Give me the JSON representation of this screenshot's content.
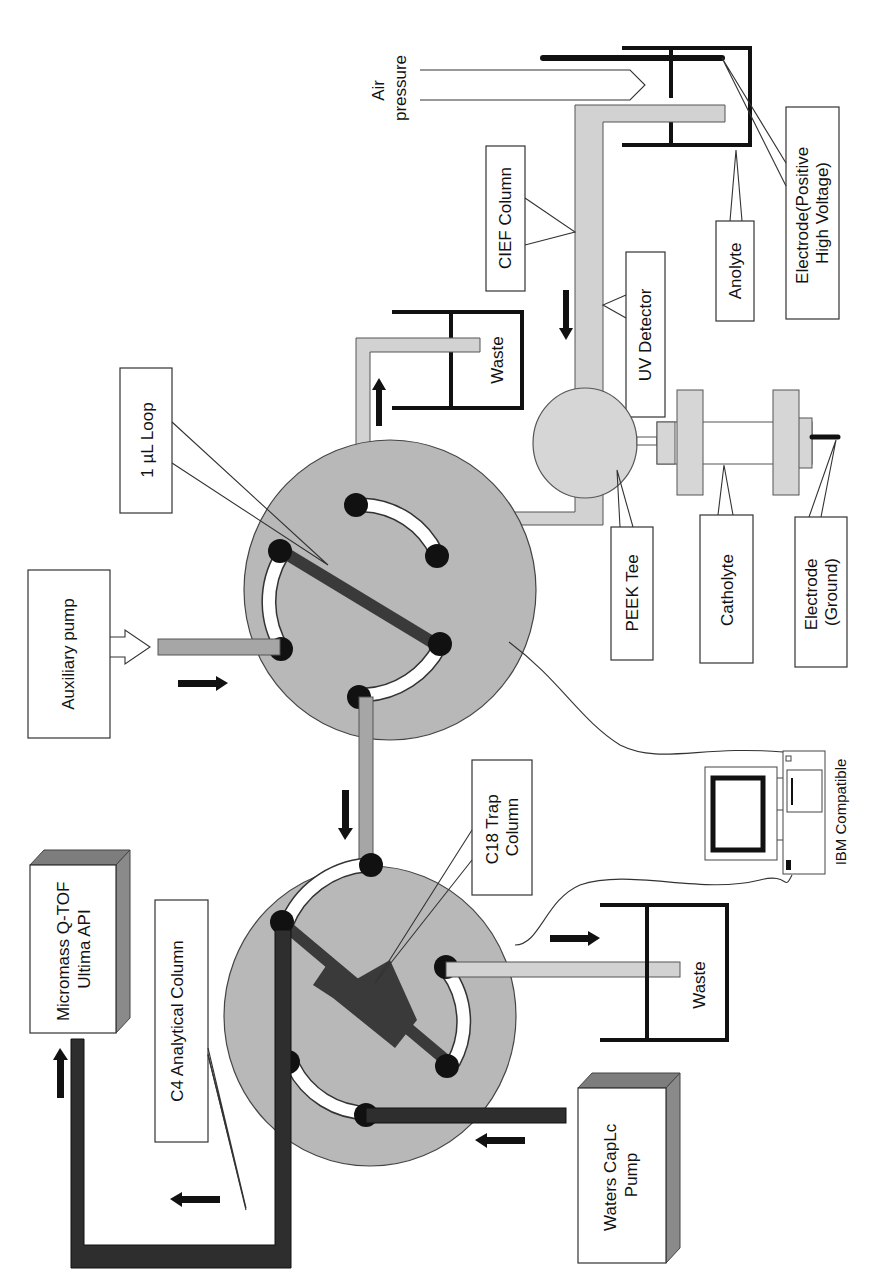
{
  "figure": {
    "type": "instrument schematic",
    "orientation": "rotated 90 degrees counter-clockwise"
  },
  "labels": {
    "air_pressure": [
      "Air",
      "pressure"
    ],
    "cief_column": "CIEF Column",
    "uv_detector": "UV Detector",
    "anolyte": "Anolyte",
    "electrode_positive": [
      "Electrode(Positive",
      "High Voltage)"
    ],
    "waste_top": "Waste",
    "loop": "1 µL Loop",
    "auxiliary_pump": "Auxiliary pump",
    "peek_tee": "PEEK Tee",
    "catholyte": "Catholyte",
    "electrode_ground": [
      "Electrode",
      "(Ground)"
    ],
    "c18_trap": [
      "C18 Trap",
      "Column"
    ],
    "ibm": "IBM Compatible",
    "micromass": [
      "Micromass Q-TOF",
      "Ultima API"
    ],
    "c4_column": "C4 Analytical Column",
    "waste_bottom": "Waste",
    "waters_pump": [
      "Waters CapLc",
      "Pump"
    ]
  },
  "colors": {
    "valve_fill": "#b8b8b8",
    "light_tube": "#d2d2d2",
    "mid_tube": "#a6a6a6",
    "dark_tube": "#2e2e2e",
    "outline": "#333333"
  }
}
